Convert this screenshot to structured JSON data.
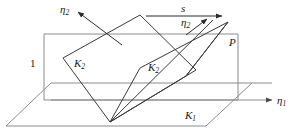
{
  "figure": {
    "type": "geometric-diagram",
    "colors": {
      "plane_line": "#8c8c8c",
      "body_line": "#3a3a3a",
      "label_text": "#1a1a1a",
      "background": "#ffffff"
    },
    "labels": [
      {
        "id": "eta2-left",
        "text": "η",
        "sub": "2",
        "x": 60,
        "y": 4,
        "italic": true
      },
      {
        "id": "s",
        "text": "s",
        "sub": "",
        "x": 181,
        "y": 3,
        "italic": true
      },
      {
        "id": "eta2-right",
        "text": "η",
        "sub": "2",
        "x": 181,
        "y": 17,
        "italic": true
      },
      {
        "id": "plane-p",
        "text": "P",
        "sub": "",
        "x": 229,
        "y": 37,
        "italic": true
      },
      {
        "id": "height-one",
        "text": "1",
        "sub": "",
        "x": 30,
        "y": 58,
        "italic": false
      },
      {
        "id": "k2-left",
        "text": "K",
        "sub": "2",
        "x": 74,
        "y": 58,
        "italic": true
      },
      {
        "id": "k2-right",
        "text": "K",
        "sub": "2",
        "x": 148,
        "y": 62,
        "italic": true
      },
      {
        "id": "k1",
        "text": "K",
        "sub": "1",
        "x": 185,
        "y": 110,
        "italic": true
      },
      {
        "id": "eta1",
        "text": "η",
        "sub": "1",
        "x": 277,
        "y": 95,
        "italic": true
      }
    ],
    "axes": [
      {
        "id": "eta1-axis",
        "label": "η₁",
        "direction": "right-horizontal"
      },
      {
        "id": "eta2-axis",
        "label": "η₂",
        "direction": "upper-left-diagonal"
      },
      {
        "id": "s-arrow",
        "label": "s",
        "direction": "right-horizontal"
      }
    ],
    "planes": [
      {
        "id": "p-plane",
        "label": "P",
        "kind": "vertical-rectangle"
      },
      {
        "id": "k1-plane",
        "label": "K₁",
        "kind": "horizontal-parallelogram"
      },
      {
        "id": "k2-plane-left",
        "label": "K₂",
        "kind": "tilted-parallelogram"
      },
      {
        "id": "k2-plane-right",
        "label": "K₂",
        "kind": "tilted-parallelogram"
      }
    ]
  }
}
